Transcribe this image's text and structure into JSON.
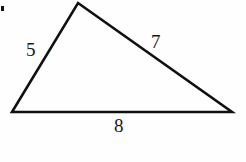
{
  "figure": {
    "kind": "geometry-diagram",
    "shape": "triangle",
    "background_color": "#fffefe",
    "stroke_color": "#101112",
    "stroke_width": 2.6,
    "label_color": "#17181a",
    "vertices": {
      "apex": {
        "x": 78,
        "y": 3
      },
      "bottom_left": {
        "x": 12,
        "y": 112
      },
      "bottom_right": {
        "x": 232,
        "y": 112
      }
    },
    "sides": [
      {
        "name": "left-side",
        "label": "5",
        "label_x": 26,
        "label_y": 40
      },
      {
        "name": "right-side",
        "label": "7",
        "label_x": 151,
        "label_y": 32
      },
      {
        "name": "base-side",
        "label": "8",
        "label_x": 114,
        "label_y": 116
      }
    ],
    "artifact": {
      "name": "edge-speck",
      "x": 1,
      "y": 6,
      "width": 3,
      "height": 5
    }
  },
  "labels": {
    "left": "5",
    "right": "7",
    "base": "8"
  }
}
